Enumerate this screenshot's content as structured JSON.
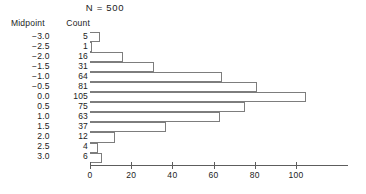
{
  "header": {
    "n_label": "N  =  500"
  },
  "table": {
    "columns": [
      "Midpoint",
      "Count"
    ],
    "rows": [
      {
        "midpoint": "−3.0",
        "count": "5"
      },
      {
        "midpoint": "−2.5",
        "count": "1"
      },
      {
        "midpoint": "−2.0",
        "count": "16"
      },
      {
        "midpoint": "−1.5",
        "count": "31"
      },
      {
        "midpoint": "−1.0",
        "count": "64"
      },
      {
        "midpoint": "−0.5",
        "count": "81"
      },
      {
        "midpoint": "0.0",
        "count": "105"
      },
      {
        "midpoint": "0.5",
        "count": "75"
      },
      {
        "midpoint": "1.0",
        "count": "63"
      },
      {
        "midpoint": "1.5",
        "count": "37"
      },
      {
        "midpoint": "2.0",
        "count": "12"
      },
      {
        "midpoint": "2.5",
        "count": "4"
      },
      {
        "midpoint": "3.0",
        "count": "6"
      }
    ]
  },
  "chart_data": {
    "type": "bar",
    "orientation": "horizontal",
    "title": "N  =  500",
    "xlabel": "",
    "ylabel": "",
    "categories": [
      "-3.0",
      "-2.5",
      "-2.0",
      "-1.5",
      "-1.0",
      "-0.5",
      "0.0",
      "0.5",
      "1.0",
      "1.5",
      "2.0",
      "2.5",
      "3.0"
    ],
    "values": [
      5,
      1,
      16,
      31,
      64,
      81,
      105,
      75,
      63,
      37,
      12,
      4,
      6
    ],
    "xlim": [
      0,
      120
    ],
    "xticks": [
      0,
      20,
      40,
      60,
      80,
      100
    ],
    "xtick_labels": [
      "0",
      "20",
      "40",
      "60",
      "80",
      "100"
    ],
    "grid": false,
    "legend": null,
    "bar_fill": "#ffffff",
    "bar_stroke": "#7d7d7d",
    "axis_color": "#5d5d5d"
  }
}
